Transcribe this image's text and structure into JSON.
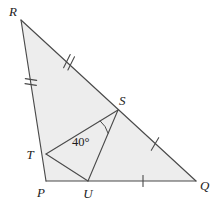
{
  "figure": {
    "background_color": "#ffffff",
    "shade_color": "#ededed",
    "line_color": "#4a4a4a",
    "text_color": "#1c1c1c"
  },
  "labels": {
    "R": "R",
    "S": "S",
    "T": "T",
    "P": "P",
    "U": "U",
    "Q": "Q",
    "angle_TSU": "40°"
  },
  "points": {
    "R": {
      "x": 21,
      "y": 20
    },
    "P": {
      "x": 46,
      "y": 181
    },
    "Q": {
      "x": 196,
      "y": 181
    },
    "S": {
      "x": 118,
      "y": 110
    },
    "T": {
      "x": 46,
      "y": 154
    },
    "U": {
      "x": 88,
      "y": 181
    }
  },
  "label_positions": {
    "R": {
      "x": 9,
      "y": 16
    },
    "S": {
      "x": 119,
      "y": 105
    },
    "T": {
      "x": 30,
      "y": 159
    },
    "P": {
      "x": 37,
      "y": 196
    },
    "U": {
      "x": 83,
      "y": 198
    },
    "Q": {
      "x": 199,
      "y": 190
    },
    "angle_TSU": {
      "x": 74,
      "y": 146
    }
  },
  "edges": [
    {
      "name": "RP",
      "from": "R",
      "to": "P"
    },
    {
      "name": "PQ",
      "from": "P",
      "to": "Q"
    },
    {
      "name": "RQ",
      "from": "R",
      "to": "Q"
    }
  ],
  "cevians": [
    {
      "name": "TS",
      "from": "T",
      "to": "S"
    },
    {
      "name": "SU",
      "from": "S",
      "to": "U"
    },
    {
      "name": "TU",
      "from": "T",
      "to": "U"
    }
  ],
  "tick_marks": [
    {
      "name": "tick-RT",
      "segment": "R-T",
      "count": 2,
      "x": 31,
      "y": 81,
      "angle": -81
    },
    {
      "name": "tick-RS",
      "segment": "R-S",
      "count": 2,
      "x": 68,
      "y": 62,
      "angle": -27
    },
    {
      "name": "tick-SQ",
      "segment": "S-Q",
      "count": 1,
      "x": 155,
      "y": 144,
      "angle": -27
    },
    {
      "name": "tick-UQ",
      "segment": "U-Q",
      "count": 1,
      "x": 143,
      "y": 181,
      "angle": 0
    }
  ],
  "angle_marks": [
    {
      "name": "angle-arc-TSU",
      "vertex": "S",
      "value": "40°",
      "radius": 26
    }
  ]
}
